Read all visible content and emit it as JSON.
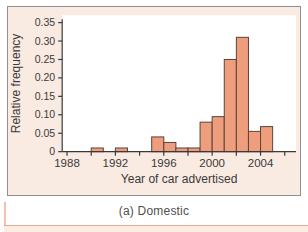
{
  "figure": {
    "caption": "(a) Domestic",
    "panel_bg": "#f9ebe2",
    "panel_border": "#8f8f8f",
    "lower_panel_fill": "#fbece4",
    "lower_panel_border": "#e3ab92"
  },
  "chart_data": {
    "type": "bar",
    "subtype": "histogram",
    "title": "",
    "xlabel": "Year of car advertised",
    "ylabel": "Relative frequency",
    "caption": "(a) Domestic",
    "xlim": [
      1987.6,
      2006.93
    ],
    "ylim": [
      0,
      0.37
    ],
    "bin_width_years": 1,
    "bins": [
      {
        "year": 1990,
        "rel_freq": 0.01
      },
      {
        "year": 1992,
        "rel_freq": 0.01
      },
      {
        "year": 1995,
        "rel_freq": 0.04
      },
      {
        "year": 1996,
        "rel_freq": 0.025
      },
      {
        "year": 1997,
        "rel_freq": 0.01
      },
      {
        "year": 1998,
        "rel_freq": 0.01
      },
      {
        "year": 1999,
        "rel_freq": 0.08
      },
      {
        "year": 2000,
        "rel_freq": 0.095
      },
      {
        "year": 2001,
        "rel_freq": 0.25
      },
      {
        "year": 2002,
        "rel_freq": 0.31
      },
      {
        "year": 2003,
        "rel_freq": 0.055
      },
      {
        "year": 2004,
        "rel_freq": 0.068
      }
    ],
    "ytick_values": [
      0,
      0.05,
      0.1,
      0.15,
      0.2,
      0.25,
      0.3,
      0.35
    ],
    "ytick_labels": [
      "0",
      "0.05",
      "0.10",
      "0.15",
      "0.20",
      "0.25",
      "0.30",
      "0.35"
    ],
    "xtick_minor_years": [
      1988,
      1990,
      1992,
      1994,
      1996,
      1998,
      2000,
      2002,
      2004,
      2006
    ],
    "xtick_labeled_years": [
      "1988",
      "1992",
      "1996",
      "2000",
      "2004"
    ],
    "grid": false,
    "legend": null,
    "plot_bg": "#ffffff",
    "axis_color": "#3a3a3a",
    "bar_fill": "#ef9e7d",
    "bar_stroke": "#5c4339"
  }
}
